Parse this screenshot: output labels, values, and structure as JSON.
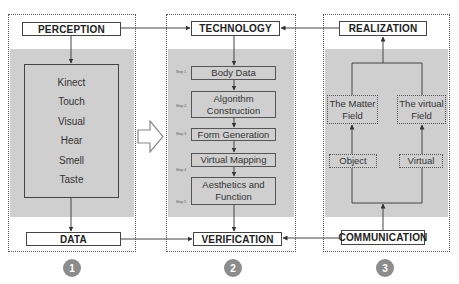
{
  "panels": [
    {
      "id": 1,
      "number": "1",
      "top_label": "PERCEPTION",
      "bottom_label": "DATA",
      "senses": [
        "Kinect",
        "Touch",
        "Visual",
        "Hear",
        "Smell",
        "Taste"
      ]
    },
    {
      "id": 2,
      "number": "2",
      "top_label": "TECHNOLOGY",
      "bottom_label": "VERIFICATION",
      "steps": [
        {
          "step": "Step 1",
          "label": "Body Data"
        },
        {
          "step": "Step 2",
          "label_line1": "Algorithm",
          "label_line2": "Construction"
        },
        {
          "step": "Step 3",
          "label": "Form Generation"
        },
        {
          "step": "Step 4",
          "label": "Virtual Mapping"
        },
        {
          "step": "Step 5",
          "label_line1": "Aesthetics and",
          "label_line2": "Function"
        }
      ]
    },
    {
      "id": 3,
      "number": "3",
      "top_label": "REALIZATION",
      "bottom_label": "COMMUNICATION",
      "fields": [
        {
          "line1": "The Matter",
          "line2": "Field",
          "source": "Object"
        },
        {
          "line1": "The virtual",
          "line2": "Field",
          "source": "Virtual"
        }
      ]
    }
  ],
  "colors": {
    "panel_fill": "#cfcfcf",
    "line": "#444444",
    "number_circle": "#8c8c8c"
  }
}
